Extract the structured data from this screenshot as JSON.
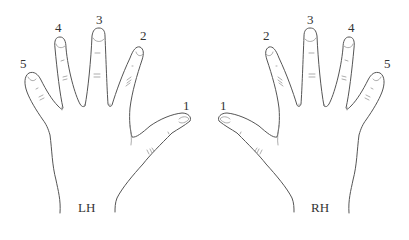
{
  "diagram": {
    "hands": [
      {
        "id": "left",
        "label": "LH",
        "fingers": [
          {
            "number": "1",
            "name": "thumb"
          },
          {
            "number": "2",
            "name": "index"
          },
          {
            "number": "3",
            "name": "middle"
          },
          {
            "number": "4",
            "name": "ring"
          },
          {
            "number": "5",
            "name": "little"
          }
        ]
      },
      {
        "id": "right",
        "label": "RH",
        "fingers": [
          {
            "number": "1",
            "name": "thumb"
          },
          {
            "number": "2",
            "name": "index"
          },
          {
            "number": "3",
            "name": "middle"
          },
          {
            "number": "4",
            "name": "ring"
          },
          {
            "number": "5",
            "name": "little"
          }
        ]
      }
    ],
    "colors": {
      "outline": "#555555",
      "text": "#333333",
      "background": "#ffffff"
    }
  }
}
